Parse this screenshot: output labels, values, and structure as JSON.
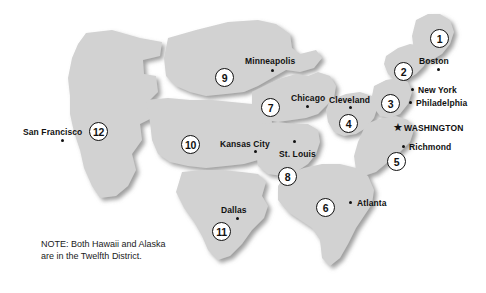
{
  "map": {
    "title": "Federal Reserve Districts Map",
    "land_color": "#d2d2d2",
    "gap_color": "#ffffff",
    "shadow_color": "#9a9a9a",
    "text_color": "#111111",
    "background": "#ffffff"
  },
  "note": {
    "line1": "NOTE: Both Hawaii and Alaska",
    "line2": "are in the Twelfth District."
  },
  "districts": [
    {
      "number": "1",
      "x": 430,
      "y": 29
    },
    {
      "number": "2",
      "x": 394,
      "y": 62
    },
    {
      "number": "3",
      "x": 381,
      "y": 94
    },
    {
      "number": "4",
      "x": 339,
      "y": 114
    },
    {
      "number": "5",
      "x": 387,
      "y": 152
    },
    {
      "number": "6",
      "x": 316,
      "y": 198
    },
    {
      "number": "7",
      "x": 261,
      "y": 98
    },
    {
      "number": "8",
      "x": 278,
      "y": 167
    },
    {
      "number": "9",
      "x": 215,
      "y": 68
    },
    {
      "number": "10",
      "x": 181,
      "y": 135
    },
    {
      "number": "11",
      "x": 212,
      "y": 222
    },
    {
      "number": "12",
      "x": 89,
      "y": 122
    }
  ],
  "cities": [
    {
      "name": "Boston",
      "label_x": 419,
      "label_y": 57,
      "dot_x": 437,
      "dot_y": 68,
      "icon": "city-dot"
    },
    {
      "name": "New York",
      "label_x": 418,
      "label_y": 86,
      "dot_x": 411,
      "dot_y": 88,
      "icon": "city-dot"
    },
    {
      "name": "Philadelphia",
      "label_x": 416,
      "label_y": 99,
      "dot_x": 409,
      "dot_y": 101,
      "icon": "city-dot"
    },
    {
      "name": "WASHINGTON",
      "label_x": 404,
      "label_y": 124,
      "dot_x": 393,
      "dot_y": 122,
      "icon": "star"
    },
    {
      "name": "Richmond",
      "label_x": 409,
      "label_y": 143,
      "dot_x": 402,
      "dot_y": 145,
      "icon": "city-dot"
    },
    {
      "name": "Atlanta",
      "label_x": 357,
      "label_y": 199,
      "dot_x": 349,
      "dot_y": 201,
      "icon": "city-dot"
    },
    {
      "name": "Cleveland",
      "label_x": 329,
      "label_y": 96,
      "dot_x": 349,
      "dot_y": 106,
      "icon": "city-dot"
    },
    {
      "name": "Chicago",
      "label_x": 291,
      "label_y": 94,
      "dot_x": 306,
      "dot_y": 105,
      "icon": "city-dot"
    },
    {
      "name": "St. Louis",
      "label_x": 279,
      "label_y": 150,
      "dot_x": 293,
      "dot_y": 140,
      "icon": "city-dot"
    },
    {
      "name": "Kansas City",
      "label_x": 220,
      "label_y": 140,
      "dot_x": 254,
      "dot_y": 150,
      "icon": "city-dot"
    },
    {
      "name": "Minneapolis",
      "label_x": 245,
      "label_y": 57,
      "dot_x": 271,
      "dot_y": 69,
      "icon": "city-dot"
    },
    {
      "name": "Dallas",
      "label_x": 221,
      "label_y": 206,
      "dot_x": 236,
      "dot_y": 217,
      "icon": "city-dot"
    },
    {
      "name": "San Francisco",
      "label_x": 23,
      "label_y": 128,
      "dot_x": 61,
      "dot_y": 139,
      "icon": "city-dot"
    }
  ],
  "chart_data": {
    "type": "map",
    "regions": [
      {
        "id": "1",
        "bank": "Boston"
      },
      {
        "id": "2",
        "bank": "New York"
      },
      {
        "id": "3",
        "bank": "Philadelphia"
      },
      {
        "id": "4",
        "bank": "Cleveland"
      },
      {
        "id": "5",
        "bank": "Richmond"
      },
      {
        "id": "6",
        "bank": "Atlanta"
      },
      {
        "id": "7",
        "bank": "Chicago"
      },
      {
        "id": "8",
        "bank": "St. Louis"
      },
      {
        "id": "9",
        "bank": "Minneapolis"
      },
      {
        "id": "10",
        "bank": "Kansas City"
      },
      {
        "id": "11",
        "bank": "Dallas"
      },
      {
        "id": "12",
        "bank": "San Francisco"
      }
    ],
    "capital": "WASHINGTON",
    "annotation": "NOTE: Both Hawaii and Alaska are in the Twelfth District."
  }
}
